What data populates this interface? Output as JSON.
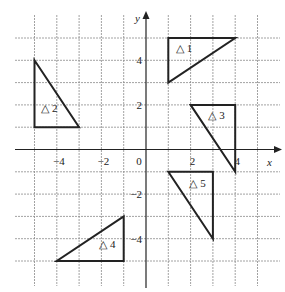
{
  "diagram": {
    "type": "coordinate-grid",
    "origin_px": [
      146,
      149.5
    ],
    "unit_px": 22.3,
    "x_range": [
      -5,
      5
    ],
    "y_range": [
      -5,
      5
    ],
    "axis_labels": {
      "x": "x",
      "y": "y"
    },
    "x_ticks": [
      {
        "value": -4,
        "label": "−4"
      },
      {
        "value": -2,
        "label": "−2"
      },
      {
        "value": 0,
        "label": "0"
      },
      {
        "value": 2,
        "label": "2"
      },
      {
        "value": 4,
        "label": "4"
      }
    ],
    "y_ticks": [
      {
        "value": 4,
        "label": "4"
      },
      {
        "value": 2,
        "label": "2"
      },
      {
        "value": -2,
        "label": "−2"
      },
      {
        "value": -4,
        "label": "−4"
      }
    ],
    "triangles": [
      {
        "label": "△ 1",
        "vertices": [
          [
            1,
            5
          ],
          [
            4,
            5
          ],
          [
            1,
            3
          ]
        ],
        "label_pos": [
          1.35,
          4.35
        ]
      },
      {
        "label": "△ 2",
        "vertices": [
          [
            -5,
            4
          ],
          [
            -5,
            1
          ],
          [
            -3,
            1
          ]
        ],
        "label_pos": [
          -4.7,
          1.7
        ]
      },
      {
        "label": "△ 3",
        "vertices": [
          [
            2,
            2
          ],
          [
            4,
            2
          ],
          [
            4,
            -1
          ]
        ],
        "label_pos": [
          2.8,
          1.35
        ]
      },
      {
        "label": "△ 4",
        "vertices": [
          [
            -1,
            -3
          ],
          [
            -1,
            -5
          ],
          [
            -4,
            -5
          ]
        ],
        "label_pos": [
          -2.1,
          -4.4
        ]
      },
      {
        "label": "△ 5",
        "vertices": [
          [
            1,
            -1
          ],
          [
            3,
            -1
          ],
          [
            3,
            -4
          ]
        ],
        "label_pos": [
          1.95,
          -1.7
        ]
      }
    ]
  }
}
